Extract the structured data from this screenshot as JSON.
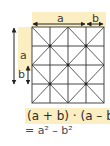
{
  "diagram": {
    "top_labels": {
      "a": "a",
      "b": "b"
    },
    "left_labels": {
      "a": "a",
      "b": "b"
    },
    "formula": {
      "line1": "(a + b) · (a – b)",
      "line2": "= a² – b²"
    },
    "grid": {
      "rows": 4,
      "cols": 4
    },
    "colors": {
      "highlight": "#fbeec3",
      "line": "#333333",
      "text": "#2b2b2b"
    }
  }
}
